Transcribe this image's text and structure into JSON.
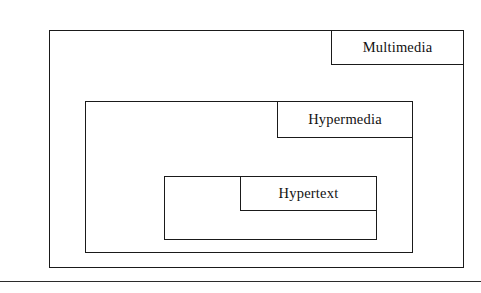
{
  "figure": {
    "type": "nested-set-venn-diagram",
    "title": "",
    "background_color": "#ffffff",
    "line_color": "#1a1a1a",
    "text_color": "#111111"
  },
  "boxes": [
    {
      "id": "multimedia",
      "label": "Multimedia",
      "level": 0,
      "contains": "hypermedia",
      "rect": {
        "x": 49,
        "y": 30,
        "width": 415,
        "height": 238
      },
      "label_tab": {
        "x": 331,
        "y": 30,
        "width": 133,
        "height": 35,
        "align": "top-right"
      }
    },
    {
      "id": "hypermedia",
      "label": "Hypermedia",
      "level": 1,
      "contains": "hypertext",
      "rect": {
        "x": 85,
        "y": 101,
        "width": 328,
        "height": 152
      },
      "label_tab": {
        "x": 277,
        "y": 101,
        "width": 136,
        "height": 37,
        "align": "top-right"
      }
    },
    {
      "id": "hypertext",
      "label": "Hypertext",
      "level": 2,
      "contains": null,
      "rect": {
        "x": 164,
        "y": 176,
        "width": 213,
        "height": 64
      },
      "label_tab": {
        "x": 240,
        "y": 176,
        "width": 137,
        "height": 35,
        "align": "top-right"
      }
    }
  ],
  "rule": {
    "id": "page-rule",
    "y": 281,
    "width": 481,
    "color": "#2b2b2b"
  }
}
